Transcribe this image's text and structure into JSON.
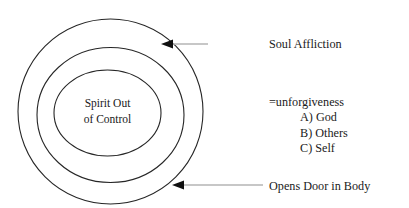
{
  "diagram": {
    "type": "concentric-circles",
    "center_label": {
      "lines": [
        "Spirit Out",
        "of Control"
      ]
    },
    "rings": [
      {
        "name": "outer-ring",
        "cx": 110.5,
        "cy": 111.5,
        "rx": 92.5,
        "ry": 92.5
      },
      {
        "name": "middle-ring",
        "cx": 110.5,
        "cy": 111.5,
        "rx": 73.5,
        "ry": 67.5
      },
      {
        "name": "inner-ring",
        "cx": 110.5,
        "cy": 111.5,
        "rx": 53.5,
        "ry": 43.0
      }
    ],
    "annotations": {
      "soul_affliction": "Soul Affliction",
      "unforgiveness_heading": "=unforgiveness",
      "unforgiveness_items": [
        "A) God",
        "B) Others",
        "C) Self"
      ],
      "opens_door": "Opens Door in Body"
    },
    "callouts": [
      {
        "name": "soul-affliction-callout",
        "target_x": 161,
        "target_y": 44,
        "line_start_x": 172,
        "line_end_x": 208
      },
      {
        "name": "opens-door-callout",
        "target_x": 172,
        "target_y": 185,
        "line_start_x": 183,
        "line_end_x": 263
      }
    ],
    "colors": {
      "stroke": "#262626",
      "leader": "#b4b4b4",
      "arrow_head": "#101010",
      "text": "#1a1a1a",
      "background": "#ffffff"
    }
  }
}
